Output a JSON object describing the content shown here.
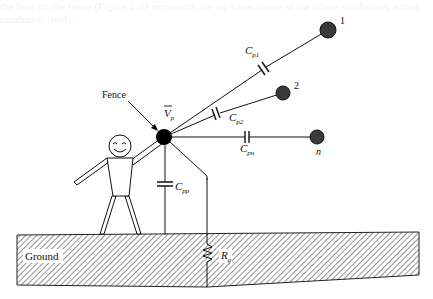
{
  "bleed_through": {
    "line1": "the how on the fence (Figure 2.33 represents the eq. capacitance of the phase conductors across",
    "line2": "conductor (body ..."
  },
  "diagram": {
    "labels": {
      "fence": "Fence",
      "vp": "V",
      "vp_sub": "p",
      "cp1": "C",
      "cp1_sub": "p1",
      "cp2": "C",
      "cp2_sub": "p2",
      "cpn": "C",
      "cpn_sub": "pn",
      "cpp": "C",
      "cpp_sub": "pp",
      "rg": "R",
      "rg_sub": "g",
      "ground": "Ground",
      "node1": "1",
      "node2": "2",
      "noden": "n"
    },
    "colors": {
      "line": "#1a1a1a",
      "phase_ball": "#3a3a3a",
      "fence_node": "#000000",
      "hatch": "#555555"
    }
  }
}
